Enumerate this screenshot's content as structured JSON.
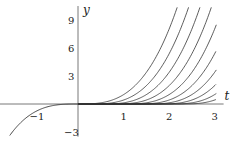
{
  "chart_data": {
    "type": "line",
    "title": "",
    "xlabel": "t",
    "ylabel": "y",
    "xlim": [
      -1.7,
      3.2
    ],
    "ylim": [
      -3.5,
      10.5
    ],
    "grid": false,
    "legend": null,
    "x_ticks": [
      "-1",
      "1",
      "2",
      "3"
    ],
    "y_ticks": [
      "-3",
      "3",
      "6",
      "9"
    ],
    "series": [
      {
        "name": "c=0",
        "c": 0
      },
      {
        "name": "c=0.25",
        "c": 0.25
      },
      {
        "name": "c=0.5",
        "c": 0.5
      },
      {
        "name": "c=0.75",
        "c": 0.75
      },
      {
        "name": "c=1",
        "c": 1
      },
      {
        "name": "c=1.25",
        "c": 1.25
      },
      {
        "name": "c=1.5",
        "c": 1.5
      },
      {
        "name": "c=1.75",
        "c": 1.75
      },
      {
        "name": "c=2",
        "c": 2
      },
      {
        "name": "c=2.25",
        "c": 2.25
      }
    ],
    "left_branch": {
      "name": "y=t^3 (t<0)",
      "t_range": [
        -1.5,
        0
      ]
    }
  },
  "layout": {
    "origin_x": 78,
    "origin_y": 104,
    "px_per_t": 45.5,
    "px_per_y": 9.33,
    "stroke": "#333333"
  }
}
